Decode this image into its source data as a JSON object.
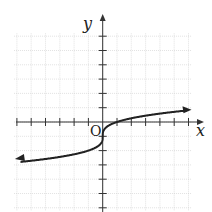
{
  "chart_data": {
    "type": "line",
    "title": "",
    "xlabel": "x",
    "ylabel": "y",
    "origin_label": "O",
    "function": "y = cbrt(x) - 1",
    "xlim": [
      -6,
      6
    ],
    "ylim": [
      -6,
      6
    ],
    "grid": true,
    "tick_spacing": 1,
    "x": [
      -6,
      -5,
      -4,
      -3,
      -2,
      -1,
      -0.5,
      0,
      0.125,
      0.5,
      1,
      2,
      3,
      4,
      5,
      6
    ],
    "series": [
      {
        "name": "f(x)",
        "values": [
          -2.82,
          -2.71,
          -2.59,
          -2.44,
          -2.26,
          -2.0,
          -1.79,
          -1.0,
          -0.5,
          -0.21,
          0,
          0.26,
          0.44,
          0.59,
          0.71,
          0.82
        ]
      }
    ],
    "arrows": [
      "both-ends"
    ]
  },
  "labels": {
    "x_axis": "x",
    "y_axis": "y",
    "origin": "O"
  }
}
